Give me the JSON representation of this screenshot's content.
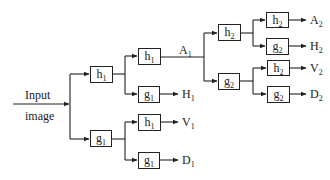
{
  "diagram": {
    "type": "two-level wavelet decomposition filter bank",
    "input_label_line1": "Input",
    "input_label_line2": "image",
    "level1": {
      "low_filter": {
        "base": "h",
        "sub": "1"
      },
      "high_filter": {
        "base": "g",
        "sub": "1"
      }
    },
    "level1_branches": [
      {
        "base": "h",
        "sub": "1"
      },
      {
        "base": "g",
        "sub": "1"
      },
      {
        "base": "h",
        "sub": "1"
      },
      {
        "base": "g",
        "sub": "1"
      }
    ],
    "level1_outputs": [
      {
        "base": "A",
        "sub": "1"
      },
      {
        "base": "H",
        "sub": "1"
      },
      {
        "base": "V",
        "sub": "1"
      },
      {
        "base": "D",
        "sub": "1"
      }
    ],
    "level2": {
      "low_filter": {
        "base": "h",
        "sub": "2"
      },
      "high_filter": {
        "base": "g",
        "sub": "2"
      }
    },
    "level2_branches": [
      {
        "base": "h",
        "sub": "2"
      },
      {
        "base": "g",
        "sub": "2"
      },
      {
        "base": "h",
        "sub": "2"
      },
      {
        "base": "g",
        "sub": "2"
      }
    ],
    "level2_outputs": [
      {
        "base": "A",
        "sub": "2"
      },
      {
        "base": "H",
        "sub": "2"
      },
      {
        "base": "V",
        "sub": "2"
      },
      {
        "base": "D",
        "sub": "2"
      }
    ],
    "colors": {
      "line": "#222222",
      "background": "#ffffff"
    }
  }
}
